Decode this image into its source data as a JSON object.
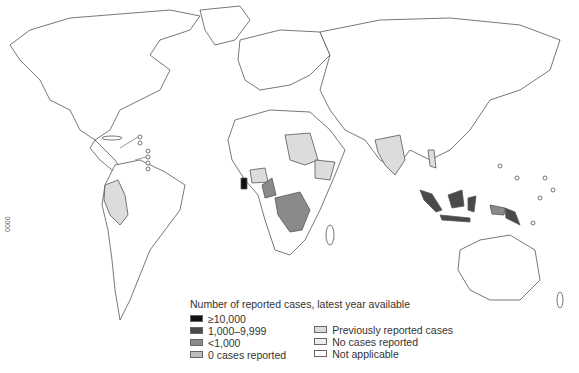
{
  "legend": {
    "title": "Number of reported cases, latest year available",
    "items_left": [
      {
        "label": "≥10,000",
        "color": "#111111"
      },
      {
        "label": "1,000–9,999",
        "color": "#4a4a4a"
      },
      {
        "label": "<1,000",
        "color": "#8a8a8a"
      },
      {
        "label": "0 cases reported",
        "color": "#bdbdbd"
      }
    ],
    "items_right": [
      {
        "label": "Previously reported cases",
        "color": "#dcdcdc"
      },
      {
        "label": "No cases reported",
        "color": "#eeeeee"
      },
      {
        "label": "Not applicable",
        "color": "#ffffff"
      }
    ]
  },
  "side_code": "0000",
  "highlighted_regions": {
    "ge10k": [
      "Ghana"
    ],
    "k1to9": [
      "Indonesia",
      "Papua New Guinea"
    ],
    "lt1k": [
      "Nigeria-Cameroon",
      "Democratic Republic of the Congo",
      "Gabon-Congo",
      "Papua (Indonesia)"
    ],
    "previously_reported": [
      "Sudan",
      "Ethiopia",
      "India",
      "Peru-Ecuador",
      "Central African Republic",
      "Chad",
      "Burkina Faso",
      "Thailand"
    ]
  }
}
